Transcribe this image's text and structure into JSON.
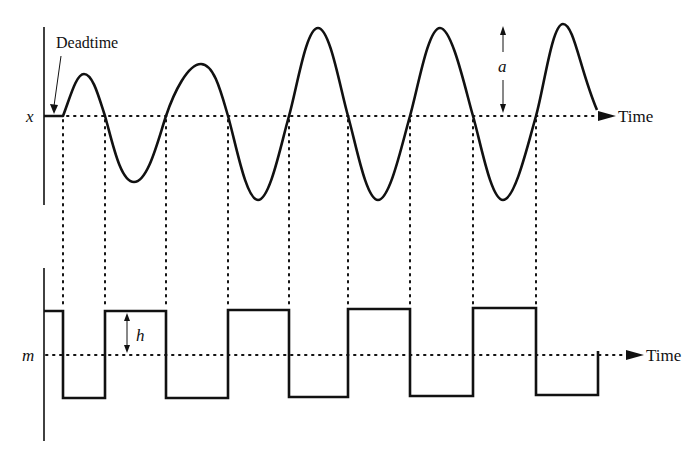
{
  "diagram": {
    "top_panel": {
      "axis_label": "x",
      "time_label": "Time",
      "annotation_deadtime": "Deadtime",
      "amplitude_label": "a"
    },
    "bottom_panel": {
      "axis_label": "m",
      "time_label": "Time",
      "amplitude_label": "h"
    },
    "colors": {
      "ink": "#111111",
      "background": "#ffffff"
    }
  }
}
